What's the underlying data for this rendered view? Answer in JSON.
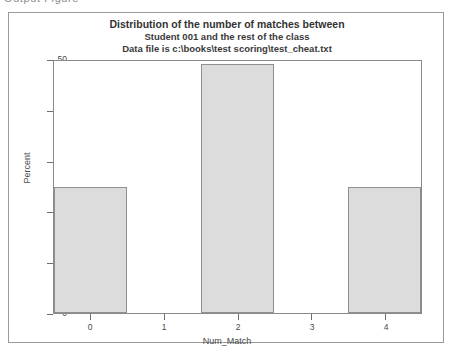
{
  "top_sliver_text": "Output  Figure",
  "figure": {
    "title_line_1": "Distribution of the number of matches between",
    "title_line_2": "Student 001 and the rest of the class",
    "title_line_3": "Data file is c:\\books\\test scoring\\test_cheat.txt"
  },
  "colors": {
    "bar_fill": "#dcdcdc",
    "bar_border": "#8f8f8f",
    "axis": "#8a8a8a",
    "frame": "#9a9a9a",
    "text": "#3a3a3a",
    "background": "#ffffff"
  },
  "axes": {
    "y_tick_labels": [
      "50",
      "40",
      "30",
      "20",
      "10",
      "0"
    ],
    "x_tick_labels": [
      "0",
      "1",
      "2",
      "3",
      "4"
    ]
  },
  "chart_data": {
    "type": "bar",
    "title": "Distribution of the number of matches between Student 001 and the rest of the class",
    "subtitle": "Data file is c:\\books\\test scoring\\test_cheat.txt",
    "xlabel": "Num_Match",
    "ylabel": "Percent",
    "categories": [
      "0",
      "1",
      "2",
      "3",
      "4"
    ],
    "values": [
      25,
      0,
      49.5,
      0,
      25
    ],
    "ylim": [
      0,
      50
    ],
    "yticks": [
      0,
      10,
      20,
      30,
      40,
      50
    ],
    "xlim": [
      -0.5,
      4.5
    ],
    "xticks": [
      0,
      1,
      2,
      3,
      4
    ],
    "grid": false,
    "legend": false,
    "bar_width": 1.0
  }
}
